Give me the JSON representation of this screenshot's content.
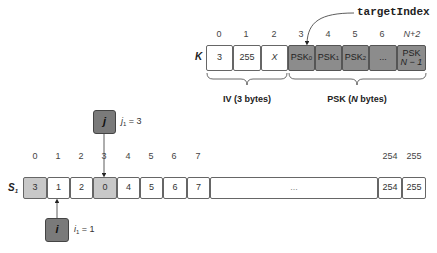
{
  "key_array": {
    "label": "K",
    "target_label": "targetIndex",
    "indices": [
      "0",
      "1",
      "2",
      "3",
      "4",
      "5",
      "6",
      "N+2"
    ],
    "cells": [
      {
        "text": "3",
        "sub": "",
        "style": "white"
      },
      {
        "text": "255",
        "sub": "",
        "style": "white"
      },
      {
        "text": "X",
        "sub": "",
        "style": "white-italic"
      },
      {
        "text": "PSK",
        "sub": "0",
        "style": "dark"
      },
      {
        "text": "PSK",
        "sub": "1",
        "style": "dark"
      },
      {
        "text": "PSK",
        "sub": "2",
        "style": "dark"
      },
      {
        "text": "...",
        "sub": "",
        "style": "dark"
      },
      {
        "text": "PSK",
        "text2": "N − 1",
        "style": "dark"
      }
    ],
    "braces": [
      {
        "label_prefix": "IV (3 bytes)",
        "label": "IV (3 bytes)"
      },
      {
        "label_a": "PSK (",
        "label_n": "N",
        "label_b": " bytes)"
      }
    ]
  },
  "state_array": {
    "label": "S",
    "label_sub": "1",
    "indices": [
      "0",
      "1",
      "2",
      "3",
      "4",
      "5",
      "6",
      "7",
      "254",
      "255"
    ],
    "cells": [
      {
        "text": "3",
        "style": "light"
      },
      {
        "text": "1",
        "style": "white"
      },
      {
        "text": "2",
        "style": "white"
      },
      {
        "text": "0",
        "style": "light"
      },
      {
        "text": "4",
        "style": "white"
      },
      {
        "text": "5",
        "style": "white"
      },
      {
        "text": "6",
        "style": "white"
      },
      {
        "text": "7",
        "style": "white"
      },
      {
        "text": "...",
        "style": "white"
      },
      {
        "text": "254",
        "style": "white"
      },
      {
        "text": "255",
        "style": "white"
      }
    ]
  },
  "pointers": {
    "j": {
      "label": "j",
      "var": "j",
      "sub": "1",
      "eq": " = 3"
    },
    "i": {
      "label": "i",
      "var": "i",
      "sub": "1",
      "eq": " = 1"
    }
  },
  "colors": {
    "psk_fill": "#8c8c8c",
    "swap_fill": "#c8c8c8",
    "pointer_fill": "#7a7a7a",
    "border": "#666666"
  }
}
